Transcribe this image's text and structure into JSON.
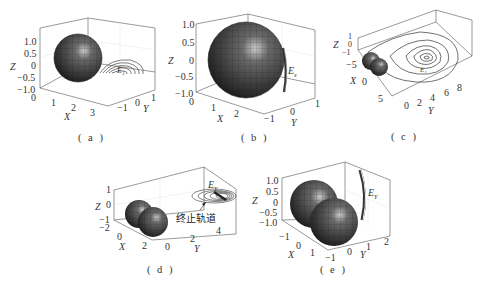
{
  "figure": {
    "panels": [
      {
        "id": "a",
        "caption": "( a )",
        "z_label": "Z",
        "x_label": "X",
        "y_label": "Y",
        "z_ticks": [
          "1.0",
          "0.5",
          "0",
          "−0.5",
          "−1.0"
        ],
        "x_ticks": [
          "0",
          "1",
          "2",
          "3"
        ],
        "y_ticks": [
          "−1",
          "0",
          "1"
        ],
        "annotation": "E₁",
        "description": "single large sphere with contour lines projected on the side wall"
      },
      {
        "id": "b",
        "caption": "( b )",
        "z_label": "Z",
        "x_label": "X",
        "y_label": "Y",
        "z_ticks": [
          "1.0",
          "0.5",
          "0",
          "−0.5",
          "−1.0"
        ],
        "x_ticks": [
          "0",
          "1",
          "2"
        ],
        "y_ticks": [
          "−1",
          "0",
          "1"
        ],
        "annotation": "Eₓ",
        "annotation_base": "E",
        "annotation_sub": "x",
        "description": "single large sphere with thin orbit family on the side"
      },
      {
        "id": "c",
        "caption": "( c )",
        "z_label": "Z",
        "x_label": "X",
        "y_label": "Y",
        "z_ticks": [
          "1",
          "0",
          "−1"
        ],
        "x_ticks": [
          "−5",
          "0",
          "5"
        ],
        "y_ticks": [
          "0",
          "2",
          "4",
          "6",
          "8"
        ],
        "annotation": "E₁",
        "description": "two small spheres with large contour field on floor"
      },
      {
        "id": "d",
        "caption": "( d )",
        "z_label": "Z",
        "x_label": "X",
        "y_label": "Y",
        "z_ticks": [
          "1",
          "0",
          "−1"
        ],
        "x_ticks": [
          "−2",
          "0",
          "2"
        ],
        "y_ticks": [
          "0",
          "2",
          "4"
        ],
        "annotation_base": "E",
        "annotation_sub": "Y",
        "note": "终止轨道",
        "description": "binary spheres, contour family ending at terminal orbit"
      },
      {
        "id": "e",
        "caption": "( e )",
        "z_label": "Z",
        "x_label": "X",
        "y_label": "Y",
        "z_ticks": [
          "1.0",
          "0.5",
          "0",
          "−0.5",
          "−1.0"
        ],
        "x_ticks": [
          "−1",
          "0",
          "1"
        ],
        "y_ticks": [
          "−1",
          "0",
          "1",
          "2"
        ],
        "annotation_base": "E",
        "annotation_sub": "Y",
        "description": "binary spheres with vertical orbit family"
      }
    ]
  }
}
